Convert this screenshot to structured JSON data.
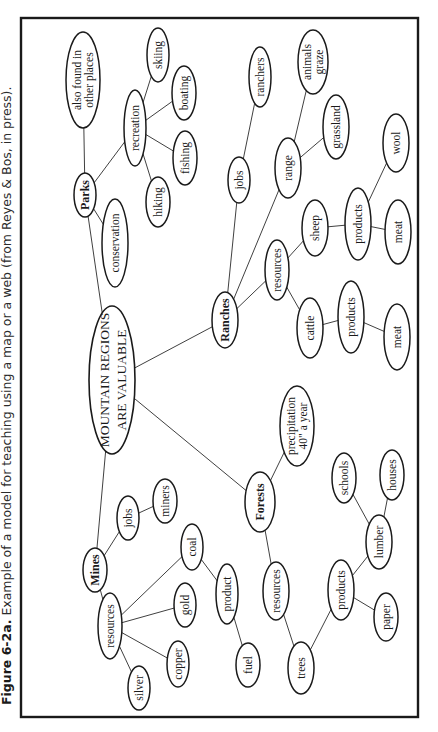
{
  "caption": {
    "figure_label": "Figure 6-2a.",
    "text": " Example of a model for teaching using a map or a web (from Reyes & Bos, in press)."
  },
  "colors": {
    "ink": "#1a1a1a",
    "background": "#ffffff"
  },
  "diagram": {
    "type": "concept-map",
    "orientation": "rotated-90-ccw",
    "central": {
      "id": "main",
      "lines": [
        "MOUNTAIN REGIONS",
        "ARE VALUABLE"
      ],
      "cx": 112,
      "cy": 380,
      "rx": 23,
      "ry": 74
    },
    "nodes": [
      {
        "id": "parks",
        "lines": [
          "Parks"
        ],
        "bold": true,
        "cx": 85,
        "cy": 195,
        "rx": 11,
        "ry": 22
      },
      {
        "id": "also_found",
        "lines": [
          "also found in",
          "other places"
        ],
        "cx": 83,
        "cy": 80,
        "rx": 17,
        "ry": 48
      },
      {
        "id": "conservation",
        "lines": [
          "conservation"
        ],
        "cx": 115,
        "cy": 243,
        "rx": 13,
        "ry": 44
      },
      {
        "id": "recreation",
        "lines": [
          "recreation"
        ],
        "cx": 135,
        "cy": 128,
        "rx": 11,
        "ry": 38
      },
      {
        "id": "skiing",
        "lines": [
          "skiing"
        ],
        "cx": 158,
        "cy": 55,
        "rx": 11,
        "ry": 27
      },
      {
        "id": "boating",
        "lines": [
          "boating"
        ],
        "cx": 184,
        "cy": 93,
        "rx": 12,
        "ry": 27
      },
      {
        "id": "fishing",
        "lines": [
          "fishing"
        ],
        "cx": 185,
        "cy": 158,
        "rx": 12,
        "ry": 27
      },
      {
        "id": "hiking",
        "lines": [
          "hiking"
        ],
        "cx": 158,
        "cy": 202,
        "rx": 12,
        "ry": 25
      },
      {
        "id": "ranches",
        "lines": [
          "Ranches"
        ],
        "bold": true,
        "cx": 225,
        "cy": 320,
        "rx": 13,
        "ry": 28
      },
      {
        "id": "ranch_jobs",
        "lines": [
          "jobs"
        ],
        "cx": 239,
        "cy": 180,
        "rx": 11,
        "ry": 23
      },
      {
        "id": "ranchers",
        "lines": [
          "ranchers"
        ],
        "cx": 260,
        "cy": 77,
        "rx": 11,
        "ry": 30
      },
      {
        "id": "range",
        "lines": [
          "range"
        ],
        "cx": 288,
        "cy": 168,
        "rx": 13,
        "ry": 30
      },
      {
        "id": "animals_graze",
        "lines": [
          "animals",
          "graze"
        ],
        "cx": 313,
        "cy": 62,
        "rx": 15,
        "ry": 32
      },
      {
        "id": "grassland",
        "lines": [
          "grassland"
        ],
        "cx": 336,
        "cy": 127,
        "rx": 13,
        "ry": 32
      },
      {
        "id": "ranch_resources",
        "lines": [
          "resources"
        ],
        "cx": 277,
        "cy": 270,
        "rx": 12,
        "ry": 30
      },
      {
        "id": "sheep",
        "lines": [
          "sheep"
        ],
        "cx": 315,
        "cy": 228,
        "rx": 13,
        "ry": 28
      },
      {
        "id": "sheep_products",
        "lines": [
          "products"
        ],
        "cx": 358,
        "cy": 224,
        "rx": 13,
        "ry": 36
      },
      {
        "id": "wool",
        "lines": [
          "wool"
        ],
        "cx": 396,
        "cy": 143,
        "rx": 13,
        "ry": 29
      },
      {
        "id": "sheep_meat",
        "lines": [
          "meat"
        ],
        "cx": 398,
        "cy": 232,
        "rx": 13,
        "ry": 32
      },
      {
        "id": "cattle",
        "lines": [
          "cattle"
        ],
        "cx": 310,
        "cy": 328,
        "rx": 13,
        "ry": 30
      },
      {
        "id": "cattle_products",
        "lines": [
          "products"
        ],
        "cx": 351,
        "cy": 317,
        "rx": 13,
        "ry": 36
      },
      {
        "id": "cattle_meat",
        "lines": [
          "meat"
        ],
        "cx": 397,
        "cy": 337,
        "rx": 13,
        "ry": 33
      },
      {
        "id": "forests",
        "lines": [
          "Forests"
        ],
        "bold": true,
        "cx": 260,
        "cy": 502,
        "rx": 15,
        "ry": 30
      },
      {
        "id": "precipitation",
        "lines": [
          "precipitation",
          "40\" a year"
        ],
        "cx": 297,
        "cy": 426,
        "rx": 17,
        "ry": 40
      },
      {
        "id": "forest_resources",
        "lines": [
          "resources"
        ],
        "cx": 276,
        "cy": 591,
        "rx": 13,
        "ry": 29
      },
      {
        "id": "trees",
        "lines": [
          "trees"
        ],
        "cx": 301,
        "cy": 668,
        "rx": 13,
        "ry": 26
      },
      {
        "id": "forest_products",
        "lines": [
          "products"
        ],
        "cx": 341,
        "cy": 590,
        "rx": 13,
        "ry": 30
      },
      {
        "id": "paper",
        "lines": [
          "paper"
        ],
        "cx": 386,
        "cy": 617,
        "rx": 12,
        "ry": 24
      },
      {
        "id": "lumber",
        "lines": [
          "lumber"
        ],
        "cx": 379,
        "cy": 542,
        "rx": 13,
        "ry": 27
      },
      {
        "id": "schools",
        "lines": [
          "schools"
        ],
        "cx": 344,
        "cy": 478,
        "rx": 12,
        "ry": 25
      },
      {
        "id": "houses",
        "lines": [
          "houses"
        ],
        "cx": 392,
        "cy": 475,
        "rx": 12,
        "ry": 25
      },
      {
        "id": "mines",
        "lines": [
          "Mines"
        ],
        "bold": true,
        "cx": 95,
        "cy": 570,
        "rx": 12,
        "ry": 22
      },
      {
        "id": "mine_jobs",
        "lines": [
          "jobs"
        ],
        "cx": 128,
        "cy": 518,
        "rx": 11,
        "ry": 22
      },
      {
        "id": "miners",
        "lines": [
          "miners"
        ],
        "cx": 165,
        "cy": 501,
        "rx": 12,
        "ry": 22
      },
      {
        "id": "mine_resources",
        "lines": [
          "resources"
        ],
        "cx": 110,
        "cy": 626,
        "rx": 12,
        "ry": 33
      },
      {
        "id": "coal",
        "lines": [
          "coal"
        ],
        "cx": 192,
        "cy": 547,
        "rx": 11,
        "ry": 23
      },
      {
        "id": "gold",
        "lines": [
          "gold"
        ],
        "cx": 185,
        "cy": 605,
        "rx": 11,
        "ry": 22
      },
      {
        "id": "copper",
        "lines": [
          "copper"
        ],
        "cx": 178,
        "cy": 664,
        "rx": 11,
        "ry": 23
      },
      {
        "id": "silver",
        "lines": [
          "silver"
        ],
        "cx": 139,
        "cy": 688,
        "rx": 11,
        "ry": 22
      },
      {
        "id": "mine_product",
        "lines": [
          "product"
        ],
        "cx": 227,
        "cy": 594,
        "rx": 11,
        "ry": 30
      },
      {
        "id": "fuel",
        "lines": [
          "fuel"
        ],
        "cx": 248,
        "cy": 665,
        "rx": 12,
        "ry": 22
      }
    ],
    "edges": [
      [
        "main",
        "parks"
      ],
      [
        "main",
        "ranches"
      ],
      [
        "main",
        "forests"
      ],
      [
        "main",
        "mines"
      ],
      [
        "parks",
        "also_found"
      ],
      [
        "parks",
        "conservation"
      ],
      [
        "parks",
        "recreation"
      ],
      [
        "recreation",
        "skiing"
      ],
      [
        "recreation",
        "boating"
      ],
      [
        "recreation",
        "fishing"
      ],
      [
        "recreation",
        "hiking"
      ],
      [
        "ranches",
        "ranch_jobs"
      ],
      [
        "ranch_jobs",
        "ranchers"
      ],
      [
        "ranches",
        "range"
      ],
      [
        "range",
        "animals_graze"
      ],
      [
        "range",
        "grassland"
      ],
      [
        "ranches",
        "ranch_resources"
      ],
      [
        "ranch_resources",
        "sheep"
      ],
      [
        "ranch_resources",
        "cattle"
      ],
      [
        "sheep",
        "sheep_products"
      ],
      [
        "sheep_products",
        "wool"
      ],
      [
        "sheep_products",
        "sheep_meat"
      ],
      [
        "cattle",
        "cattle_products"
      ],
      [
        "cattle_products",
        "cattle_meat"
      ],
      [
        "forests",
        "precipitation"
      ],
      [
        "forests",
        "forest_resources"
      ],
      [
        "forest_resources",
        "trees"
      ],
      [
        "trees",
        "forest_products"
      ],
      [
        "forest_products",
        "paper"
      ],
      [
        "forest_products",
        "lumber"
      ],
      [
        "lumber",
        "schools"
      ],
      [
        "lumber",
        "houses"
      ],
      [
        "mines",
        "mine_jobs"
      ],
      [
        "mine_jobs",
        "miners"
      ],
      [
        "mines",
        "mine_resources"
      ],
      [
        "mine_resources",
        "coal"
      ],
      [
        "mine_resources",
        "gold"
      ],
      [
        "mine_resources",
        "copper"
      ],
      [
        "mine_resources",
        "silver"
      ],
      [
        "coal",
        "mine_product"
      ],
      [
        "mine_product",
        "fuel"
      ]
    ]
  }
}
